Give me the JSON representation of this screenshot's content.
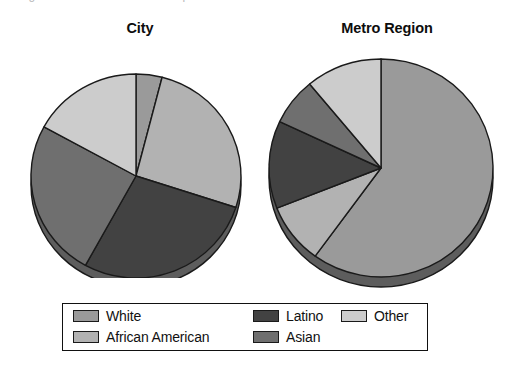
{
  "figure": {
    "cropped_caption": "Figure: Racial and ethnic composition",
    "background": "#ffffff"
  },
  "charts": {
    "city": {
      "title": "City"
    },
    "metro": {
      "title": "Metro Region"
    }
  },
  "legend": {
    "items": [
      {
        "label": "White",
        "color": "#9a9a9a"
      },
      {
        "label": "African American",
        "color": "#b2b2b2"
      },
      {
        "label": "Latino",
        "color": "#424242"
      },
      {
        "label": "Asian",
        "color": "#6f6f6f"
      },
      {
        "label": "Other",
        "color": "#cccccc"
      }
    ]
  },
  "colors": {
    "white": "#9a9a9a",
    "african_american": "#b2b2b2",
    "latino": "#424242",
    "asian": "#6f6f6f",
    "other": "#cccccc",
    "outline": "#1a1a1a",
    "shadow": "#5d5d5d"
  },
  "chart_data": [
    {
      "type": "pie",
      "title": "City",
      "categories": [
        "White",
        "African American",
        "Latino",
        "Asian",
        "Other"
      ],
      "values": [
        4,
        26,
        28,
        25,
        17
      ],
      "unit": "percent",
      "start_angle": 0,
      "direction": "clockwise",
      "legend_position": "bottom",
      "three_d": true
    },
    {
      "type": "pie",
      "title": "Metro Region",
      "categories": [
        "White",
        "African American",
        "Latino",
        "Asian",
        "Other"
      ],
      "values": [
        60,
        9,
        13,
        7,
        11
      ],
      "unit": "percent",
      "start_angle": 0,
      "direction": "clockwise",
      "legend_position": "bottom",
      "three_d": true
    }
  ]
}
